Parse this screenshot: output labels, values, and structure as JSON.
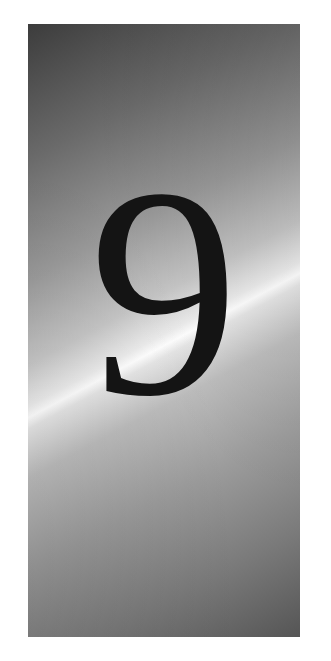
{
  "card": {
    "digit": "9"
  }
}
